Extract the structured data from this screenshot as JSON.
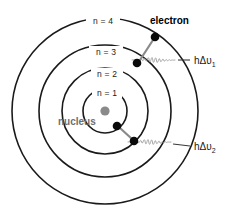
{
  "figure": {
    "background_color": "#ffffff",
    "canvas": {
      "width": 240,
      "height": 223
    }
  },
  "colors": {
    "orbit_stroke": "#1a1a1a",
    "electron_fill": "#000000",
    "nucleus_fill": "#8a8a8a",
    "nucleus_text": "#6e6e6e",
    "wave_stroke": "#9a9a9a",
    "arrow_stroke": "#7a7a7a",
    "label_text": "#1a1a1a"
  },
  "diagram": {
    "center": {
      "x": 105,
      "y": 111
    },
    "orbits": [
      {
        "id": "orbit-n1",
        "label": "n = 1",
        "radius": 22,
        "label_x": 105,
        "label_y": 94
      },
      {
        "id": "orbit-n2",
        "label": "n = 2",
        "radius": 43,
        "label_x": 105,
        "label_y": 75
      },
      {
        "id": "orbit-n3",
        "label": "n = 3",
        "radius": 66,
        "label_x": 103,
        "label_y": 53
      },
      {
        "id": "orbit-n4",
        "label": "n = 4",
        "radius": 93,
        "label_x": 100,
        "label_y": 22
      }
    ],
    "nucleus": {
      "label": "nucleus",
      "radius": 4.5,
      "label_x": 58,
      "label_y": 124
    },
    "electron_label": {
      "text": "electron",
      "x": 152,
      "y": 24
    },
    "electrons": [
      {
        "id": "electron-n4",
        "x": 155,
        "y": 37,
        "radius": 4.2,
        "orbit": "n = 4"
      },
      {
        "id": "electron-n3",
        "x": 137,
        "y": 63,
        "radius": 4.2,
        "orbit": "n = 3"
      },
      {
        "id": "electron-n2",
        "x": 134,
        "y": 141,
        "radius": 4.2,
        "orbit": "n = 2"
      },
      {
        "id": "electron-n1",
        "x": 117,
        "y": 126,
        "radius": 4.2,
        "orbit": "n = 1"
      }
    ],
    "transitions": [
      {
        "id": "transition-4-to-3",
        "from": "n = 4",
        "to": "n = 3",
        "x1": 154,
        "y1": 38,
        "x2": 139,
        "y2": 62
      },
      {
        "id": "transition-2-to-1",
        "from": "n = 2",
        "to": "n = 1",
        "x1": 133,
        "y1": 140,
        "x2": 119,
        "y2": 127
      }
    ],
    "photons": [
      {
        "id": "photon-1",
        "label": "hΔυ",
        "subscript": "1",
        "label_x": 198,
        "label_y": 63,
        "wave_x": 150,
        "wave_y": 60,
        "connector_x1": 180,
        "connector_x2": 192
      },
      {
        "id": "photon-2",
        "label": "hΔυ",
        "subscript": "2",
        "label_x": 198,
        "label_y": 148,
        "wave_x": 145,
        "wave_y": 142,
        "connector_x1": 175,
        "connector_x2": 192
      }
    ]
  }
}
